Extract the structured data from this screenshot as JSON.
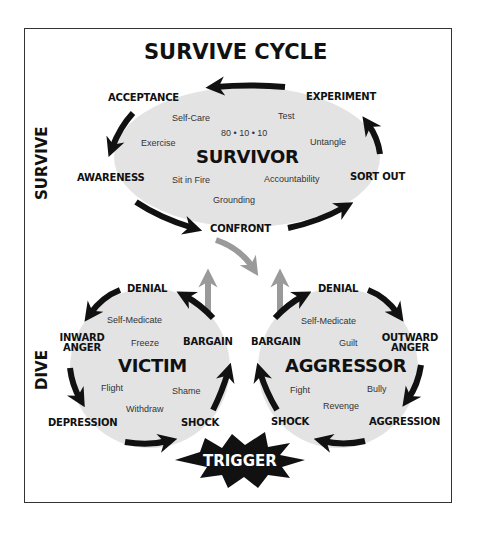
{
  "title": "SURVIVE CYCLE",
  "side_labels": {
    "survive": "SURVIVE",
    "dive": "DIVE"
  },
  "survivor": {
    "role": "SURVIVOR",
    "ratio": "80 • 10 • 10",
    "stages": {
      "acceptance": "ACCEPTANCE",
      "experiment": "EXPERIMENT",
      "awareness": "AWARENESS",
      "sort_out": "SORT OUT",
      "confront": "CONFRONT"
    },
    "items": {
      "self_care": "Self-Care",
      "test": "Test",
      "exercise": "Exercise",
      "untangle": "Untangle",
      "sit_in_fire": "Sit in Fire",
      "accountability": "Accountability",
      "grounding": "Grounding"
    }
  },
  "victim": {
    "role": "VICTIM",
    "stages": {
      "denial": "DENIAL",
      "inward_anger_1": "INWARD",
      "inward_anger_2": "ANGER",
      "bargain": "BARGAIN",
      "depression": "DEPRESSION",
      "shock": "SHOCK"
    },
    "items": {
      "self_medicate": "Self-Medicate",
      "freeze": "Freeze",
      "flight": "Flight",
      "shame": "Shame",
      "withdraw": "Withdraw"
    }
  },
  "aggressor": {
    "role": "AGGRESSOR",
    "stages": {
      "denial": "DENIAL",
      "outward_anger_1": "OUTWARD",
      "outward_anger_2": "ANGER",
      "bargain": "BARGAIN",
      "aggression": "AGGRESSION",
      "shock": "SHOCK"
    },
    "items": {
      "self_medicate": "Self-Medicate",
      "guilt": "Guilt",
      "fight": "Fight",
      "bully": "Bully",
      "revenge": "Revenge"
    }
  },
  "trigger": {
    "label": "TRIGGER"
  },
  "colors": {
    "ellipse_fill": "#e3e3e3",
    "arrow_black": "#111111",
    "arrow_gray": "#9a9a9a",
    "frame": "#333333"
  }
}
